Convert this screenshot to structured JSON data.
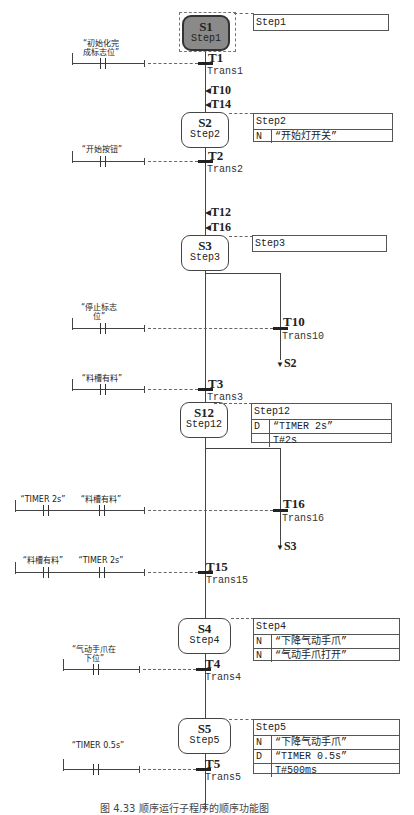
{
  "steps": [
    {
      "id": "S1",
      "name": "Step1",
      "initial": true,
      "actions_title": "Step1",
      "actions": []
    },
    {
      "id": "S2",
      "name": "Step2",
      "initial": false,
      "actions_title": "Step2",
      "actions": [
        {
          "q": "N",
          "v": "“开始灯开关”"
        }
      ]
    },
    {
      "id": "S3",
      "name": "Step3",
      "initial": false,
      "actions_title": "Step3",
      "actions": []
    },
    {
      "id": "S12",
      "name": "Step12",
      "initial": false,
      "actions_title": "Step12",
      "actions": [
        {
          "q": "D",
          "v": "“TIMER 2s”"
        },
        {
          "q": "",
          "v": "T#2s"
        }
      ]
    },
    {
      "id": "S4",
      "name": "Step4",
      "initial": false,
      "actions_title": "Step4",
      "actions": [
        {
          "q": "N",
          "v": "“下降气动手爪”"
        },
        {
          "q": "N",
          "v": "“气动手爪打开”"
        }
      ]
    },
    {
      "id": "S5",
      "name": "Step5",
      "initial": false,
      "actions_title": "Step5",
      "actions": [
        {
          "q": "N",
          "v": "“下降气动手爪”"
        },
        {
          "q": "D",
          "v": "“TIMER 0.5s”"
        },
        {
          "q": "",
          "v": "T#500ms"
        }
      ]
    }
  ],
  "transitions": [
    {
      "id": "T1",
      "name": "Trans1",
      "contacts": [
        "“初始化完\n成标志位”"
      ]
    },
    {
      "id": "T2",
      "name": "Trans2",
      "contacts": [
        "“开始按钮”"
      ]
    },
    {
      "id": "T10",
      "name": "Trans10",
      "contacts": [
        "“停止标志\n位”"
      ],
      "jump_to": "S2"
    },
    {
      "id": "T3",
      "name": "Trans3",
      "contacts": [
        "“料槽有料”"
      ]
    },
    {
      "id": "T16",
      "name": "Trans16",
      "contacts": [
        "“TIMER 2s”",
        "“料槽有料”"
      ],
      "jump_to": "S3"
    },
    {
      "id": "T15",
      "name": "Trans15",
      "contacts": [
        "“料槽有料”",
        "“TIMER 2s”"
      ]
    },
    {
      "id": "T4",
      "name": "Trans4",
      "contacts": [
        "“气动手爪在\n下位”"
      ]
    },
    {
      "id": "T5",
      "name": "Trans5",
      "contacts": [
        "“TIMER 0.5s”"
      ]
    }
  ],
  "incoming_jumps": {
    "S2": [
      "T10",
      "T14"
    ],
    "S3": [
      "T12",
      "T16"
    ]
  },
  "caption": "图 4.33  顺序运行子程序的顺序功能图"
}
